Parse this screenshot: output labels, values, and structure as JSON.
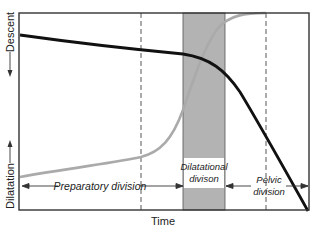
{
  "figure": {
    "type": "labor progress curve (Friedman)",
    "x_axis_label": "Time",
    "y_axis_top_label": "Descent",
    "y_axis_bottom_label": "Dilatation",
    "divisions": [
      {
        "line1": "Preparatory division",
        "line2": ""
      },
      {
        "line1": "Dilatational",
        "line2": "divison"
      },
      {
        "line1": "Pelvic",
        "line2": "division"
      }
    ],
    "curves": [
      {
        "name": "descent-curve",
        "color": "#111111"
      },
      {
        "name": "dilatation-curve",
        "color": "#aaaaaa"
      }
    ],
    "band_color": "#b3b3b3"
  }
}
